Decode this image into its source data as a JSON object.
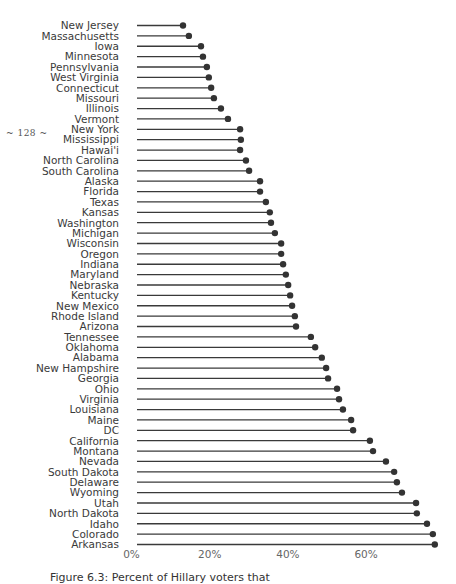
{
  "page": {
    "page_number": "~ 128 ~",
    "caption": "Figure 6.3:  Percent of Hillary voters that"
  },
  "chart_data": {
    "type": "lollipop",
    "orientation": "horizontal",
    "title": "",
    "xlabel": "",
    "ylabel": "",
    "xlim": [
      0,
      80
    ],
    "x_ticks": [
      0,
      20,
      40,
      60
    ],
    "x_tick_labels": [
      "0%",
      "20%",
      "40%",
      "60%"
    ],
    "grid": false,
    "legend": "none",
    "colors": {
      "stem": "#3a3a3a",
      "dot": "#333333"
    },
    "categories": [
      "New Jersey",
      "Massachusetts",
      "Iowa",
      "Minnesota",
      "Pennsylvania",
      "West Virginia",
      "Connecticut",
      "Missouri",
      "Illinois",
      "Vermont",
      "New York",
      "Mississippi",
      "Hawai'i",
      "North Carolina",
      "South Carolina",
      "Alaska",
      "Florida",
      "Texas",
      "Kansas",
      "Washington",
      "Michigan",
      "Wisconsin",
      "Oregon",
      "Indiana",
      "Maryland",
      "Nebraska",
      "Kentucky",
      "New Mexico",
      "Rhode Island",
      "Arizona",
      "Tennessee",
      "Oklahoma",
      "Alabama",
      "New Hampshire",
      "Georgia",
      "Ohio",
      "Virginia",
      "Louisiana",
      "Maine",
      "DC",
      "California",
      "Montana",
      "Nevada",
      "South Dakota",
      "Delaware",
      "Wyoming",
      "Utah",
      "North Dakota",
      "Idaho",
      "Colorado",
      "Arkansas"
    ],
    "values": [
      13.3,
      14.8,
      17.9,
      18.4,
      19.4,
      19.9,
      20.5,
      21.2,
      23.0,
      24.8,
      27.9,
      28.1,
      27.9,
      29.4,
      30.2,
      33.0,
      33.0,
      34.5,
      35.5,
      35.8,
      36.8,
      38.4,
      38.4,
      38.9,
      39.6,
      40.2,
      40.7,
      41.2,
      41.9,
      42.2,
      46.0,
      47.1,
      48.8,
      49.9,
      50.4,
      52.7,
      53.2,
      54.2,
      56.3,
      56.8,
      61.1,
      61.9,
      65.2,
      67.3,
      68.0,
      69.3,
      72.9,
      73.1,
      75.7,
      77.2,
      77.7
    ],
    "unit": "%"
  }
}
